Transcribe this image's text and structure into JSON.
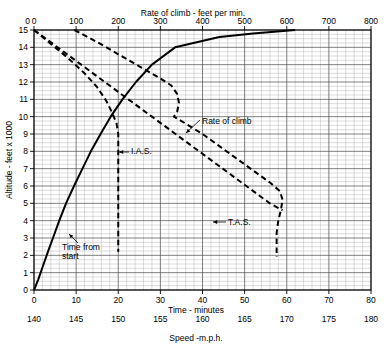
{
  "figure": {
    "name": "climb-performance-chart"
  },
  "chart_data": {
    "type": "line",
    "title": "",
    "top_axis": {
      "label": "Rate of climb - feet per min.",
      "ticks": [
        0,
        100,
        200,
        300,
        400,
        500,
        600,
        700,
        800
      ],
      "range": [
        0,
        800
      ]
    },
    "bottom_axis": {
      "label": "Time - minutes",
      "ticks": [
        0,
        10,
        20,
        30,
        40,
        50,
        60,
        70,
        80
      ],
      "range": [
        0,
        80
      ]
    },
    "bottom_axis_2": {
      "label": "Speed -m.p.h.",
      "ticks": [
        140,
        145,
        150,
        155,
        160,
        165,
        170,
        175,
        180
      ],
      "range": [
        140,
        180
      ]
    },
    "y_axis": {
      "label": "Altitude - feet x 1000",
      "ticks": [
        0,
        1,
        2,
        3,
        4,
        5,
        6,
        7,
        8,
        9,
        10,
        11,
        12,
        13,
        14,
        15
      ],
      "range": [
        0,
        15
      ]
    },
    "grid": "major and minor",
    "legend": "inline annotations",
    "series": [
      {
        "name": "Time from start",
        "style": "solid",
        "x_axis": "bottom_axis",
        "points": [
          [
            0.0,
            0.0
          ],
          [
            1.0,
            0.6
          ],
          [
            2.0,
            1.3
          ],
          [
            3.3,
            2.2
          ],
          [
            4.5,
            3.0
          ],
          [
            6.0,
            4.0
          ],
          [
            7.6,
            5.0
          ],
          [
            9.5,
            6.0
          ],
          [
            11.5,
            7.0
          ],
          [
            13.5,
            8.0
          ],
          [
            15.8,
            9.0
          ],
          [
            18.2,
            10.0
          ],
          [
            21.0,
            11.0
          ],
          [
            24.2,
            12.0
          ],
          [
            28.0,
            13.0
          ],
          [
            33.5,
            14.0
          ],
          [
            44.0,
            14.6
          ],
          [
            52.0,
            14.8
          ],
          [
            62.0,
            15.0
          ]
        ]
      },
      {
        "name": "Rate of climb",
        "style": "dashed",
        "x_axis": "top_axis",
        "points": [
          [
            0,
            15.0
          ],
          [
            28,
            14.5
          ],
          [
            56,
            14.0
          ],
          [
            84,
            13.5
          ],
          [
            112,
            13.0
          ],
          [
            140,
            12.5
          ],
          [
            168,
            12.0
          ],
          [
            196,
            11.5
          ],
          [
            224,
            11.0
          ],
          [
            252,
            10.5
          ],
          [
            280,
            10.0
          ],
          [
            308,
            9.5
          ],
          [
            336,
            9.0
          ],
          [
            364,
            8.5
          ],
          [
            392,
            8.0
          ],
          [
            420,
            7.5
          ],
          [
            448,
            7.0
          ],
          [
            476,
            6.5
          ],
          [
            504,
            6.0
          ],
          [
            532,
            5.5
          ],
          [
            560,
            5.0
          ],
          [
            590,
            4.6
          ]
        ]
      },
      {
        "name": "I.A.S.",
        "style": "dashed",
        "x_axis": "bottom_axis_2",
        "points": [
          [
            140.0,
            15.0
          ],
          [
            142.0,
            14.2
          ],
          [
            144.0,
            13.4
          ],
          [
            146.0,
            12.5
          ],
          [
            147.5,
            11.7
          ],
          [
            148.6,
            10.9
          ],
          [
            149.3,
            10.2
          ],
          [
            149.8,
            9.6
          ],
          [
            150.0,
            9.0
          ],
          [
            150.0,
            8.0
          ],
          [
            150.0,
            7.0
          ],
          [
            150.0,
            6.0
          ],
          [
            150.0,
            5.0
          ],
          [
            150.0,
            4.0
          ],
          [
            150.0,
            3.0
          ],
          [
            150.0,
            2.2
          ]
        ]
      },
      {
        "name": "T.A.S.",
        "style": "dashed",
        "x_axis": "bottom_axis_2",
        "points": [
          [
            144.8,
            15.0
          ],
          [
            147.5,
            14.3
          ],
          [
            150.0,
            13.6
          ],
          [
            152.5,
            12.9
          ],
          [
            155.0,
            12.2
          ],
          [
            156.3,
            11.8
          ],
          [
            157.0,
            11.3
          ],
          [
            157.2,
            10.8
          ],
          [
            157.0,
            10.3
          ],
          [
            156.6,
            10.0
          ],
          [
            158.0,
            9.6
          ],
          [
            160.0,
            9.0
          ],
          [
            162.0,
            8.3
          ],
          [
            164.0,
            7.6
          ],
          [
            166.0,
            6.9
          ],
          [
            168.0,
            6.2
          ],
          [
            169.2,
            5.7
          ],
          [
            169.5,
            5.2
          ],
          [
            169.3,
            4.6
          ],
          [
            169.0,
            4.0
          ],
          [
            168.8,
            3.3
          ],
          [
            168.8,
            2.6
          ],
          [
            168.8,
            1.9
          ]
        ]
      }
    ],
    "annotations": [
      {
        "text": "Rate of climb",
        "x": 202,
        "y": 124
      },
      {
        "text": "I.A.S.",
        "x": 131,
        "y": 154
      },
      {
        "text": "T.A.S.",
        "x": 228,
        "y": 225
      },
      {
        "text": "Time from",
        "x": 62,
        "y": 250
      },
      {
        "text": "start",
        "x": 62,
        "y": 259
      }
    ]
  },
  "colors": {
    "ink": "#000000",
    "grid_major": "#555555",
    "grid_minor": "#aaaaaa",
    "background": "#ffffff"
  }
}
